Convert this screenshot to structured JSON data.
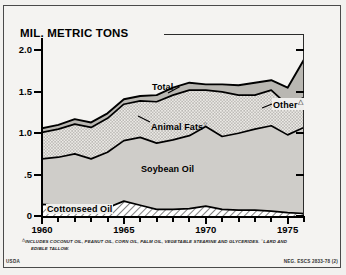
{
  "chart_title": "MIL. METRIC TONS",
  "axis": {
    "y_ticks": [
      "2.0",
      "1.5",
      "1.0",
      ".5",
      "0"
    ],
    "x_ticks": [
      "1960",
      "1965",
      "1970",
      "1975"
    ]
  },
  "labels": {
    "total": "Total",
    "other": "Other",
    "other_marker": "△",
    "animal_fats": "Animal Fats",
    "animal_marker": "○",
    "soybean_oil": "Soybean Oil",
    "cottonseed_oil": "Cottonseed Oil"
  },
  "footnotes": {
    "marker_triangle": "△",
    "marker_circle": "○",
    "line1": "INCLUDES COCONUT OIL, PEANUT OIL, CORN OIL, PALM OIL, VEGETABLE STEARINE AND GLYCERIDES.",
    "line1b": "LARD AND",
    "line2": "EDIBLE TALLOW."
  },
  "credits": {
    "agency": "USDA",
    "negative": "NEG. ESCS 2833-78 (2)"
  },
  "colors": {
    "cottonseed": "#ffffff",
    "soybean": "#cfcdc9",
    "animal_fats": "#e6e4df",
    "other": "#b9b7b2",
    "outline": "#000000",
    "background": "#f4f3f1"
  },
  "chart_data": {
    "type": "area",
    "title": "MIL. METRIC TONS",
    "xlabel": "",
    "ylabel": "MIL. METRIC TONS",
    "ylim": [
      0,
      2.15
    ],
    "xlim": [
      1960,
      1976
    ],
    "grid": false,
    "legend": "inline-labels",
    "stacked": true,
    "x": [
      1960,
      1961,
      1962,
      1963,
      1964,
      1965,
      1966,
      1967,
      1968,
      1969,
      1970,
      1971,
      1972,
      1973,
      1974,
      1975,
      1976
    ],
    "series": [
      {
        "name": "Cottonseed Oil",
        "values": [
          0.14,
          0.13,
          0.13,
          0.11,
          0.1,
          0.18,
          0.13,
          0.08,
          0.08,
          0.09,
          0.12,
          0.08,
          0.07,
          0.07,
          0.06,
          0.04,
          0.03
        ]
      },
      {
        "name": "Soybean Oil",
        "values": [
          0.55,
          0.58,
          0.62,
          0.58,
          0.67,
          0.73,
          0.82,
          0.8,
          0.84,
          0.88,
          0.96,
          0.88,
          0.93,
          0.98,
          1.03,
          0.94,
          1.04
        ]
      },
      {
        "name": "Animal Fats",
        "values": [
          0.32,
          0.34,
          0.36,
          0.38,
          0.41,
          0.44,
          0.44,
          0.5,
          0.54,
          0.55,
          0.44,
          0.54,
          0.46,
          0.41,
          0.43,
          0.36,
          0.36
        ]
      },
      {
        "name": "Other",
        "values": [
          0.05,
          0.05,
          0.06,
          0.06,
          0.06,
          0.06,
          0.06,
          0.08,
          0.09,
          0.09,
          0.07,
          0.09,
          0.12,
          0.15,
          0.12,
          0.21,
          0.46
        ]
      }
    ],
    "total": {
      "name": "Total",
      "values": [
        1.06,
        1.1,
        1.17,
        1.13,
        1.24,
        1.41,
        1.45,
        1.46,
        1.55,
        1.61,
        1.59,
        1.59,
        1.58,
        1.61,
        1.64,
        1.55,
        1.89
      ]
    }
  }
}
